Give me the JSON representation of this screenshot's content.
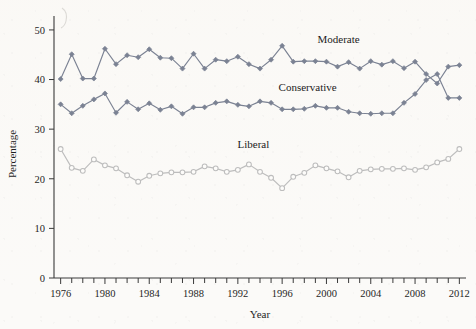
{
  "chart_data": {
    "type": "line",
    "title": "",
    "xlabel": "Year",
    "ylabel": "Percentage",
    "xlim": [
      1975.4,
      2012.6
    ],
    "ylim": [
      0,
      52
    ],
    "grid": false,
    "legend_position": "inline-labels",
    "x_tick_labels": [
      "1976",
      "1980",
      "1984",
      "1988",
      "1992",
      "1996",
      "2000",
      "2004",
      "2008",
      "2012"
    ],
    "x_tick_values": [
      1976,
      1980,
      1984,
      1988,
      1992,
      1996,
      2000,
      2004,
      2008,
      2012
    ],
    "x_minor_tick_values": [
      1976,
      1977,
      1978,
      1979,
      1980,
      1981,
      1982,
      1983,
      1984,
      1985,
      1986,
      1987,
      1988,
      1989,
      1990,
      1991,
      1992,
      1993,
      1994,
      1995,
      1996,
      1997,
      1998,
      1999,
      2000,
      2001,
      2002,
      2003,
      2004,
      2005,
      2006,
      2007,
      2008,
      2009,
      2010,
      2011,
      2012
    ],
    "y_tick_labels": [
      "0",
      "10",
      "20",
      "30",
      "40",
      "50"
    ],
    "y_tick_values": [
      0,
      10,
      20,
      30,
      40,
      50
    ],
    "x": [
      1976,
      1977,
      1978,
      1979,
      1980,
      1981,
      1982,
      1983,
      1984,
      1985,
      1986,
      1987,
      1988,
      1989,
      1990,
      1991,
      1992,
      1993,
      1994,
      1995,
      1996,
      1997,
      1998,
      1999,
      2000,
      2001,
      2002,
      2003,
      2004,
      2005,
      2006,
      2007,
      2008,
      2009,
      2010,
      2011,
      2012
    ],
    "series": [
      {
        "name": "Moderate",
        "color": "#7b8293",
        "marker": "diamond-filled",
        "label_x": 2001.1,
        "label_y": 47.4,
        "values": [
          40.1,
          45.1,
          40.2,
          40.2,
          46.2,
          43.1,
          44.9,
          44.5,
          46.1,
          44.4,
          44.3,
          42.2,
          45.2,
          42.2,
          44.0,
          43.7,
          44.6,
          43.1,
          42.2,
          44.0,
          46.8,
          43.6,
          43.7,
          43.7,
          43.6,
          42.6,
          43.5,
          42.2,
          43.7,
          43.0,
          43.7,
          42.3,
          43.6,
          41.1,
          39.2,
          42.6,
          42.9
        ]
      },
      {
        "name": "Conservative",
        "color": "#7b8293",
        "marker": "diamond-filled",
        "label_x": 1998.3,
        "label_y": 37.7,
        "values": [
          35.0,
          33.2,
          34.7,
          36.0,
          37.2,
          33.3,
          35.5,
          34.0,
          35.2,
          33.9,
          34.6,
          33.1,
          34.4,
          34.4,
          35.3,
          35.6,
          34.9,
          34.6,
          35.6,
          35.3,
          34.0,
          34.0,
          34.1,
          34.7,
          34.3,
          34.3,
          33.5,
          33.2,
          33.1,
          33.2,
          33.2,
          35.3,
          37.1,
          39.9,
          41.1,
          36.3,
          36.3
        ]
      },
      {
        "name": "Liberal",
        "color": "#bdbdbd",
        "marker": "circle-open",
        "label_x": 1993.4,
        "label_y": 26.2,
        "values": [
          26.0,
          22.2,
          21.6,
          23.9,
          22.7,
          22.1,
          20.7,
          19.4,
          20.6,
          21.1,
          21.3,
          21.3,
          21.4,
          22.5,
          22.1,
          21.4,
          21.8,
          22.9,
          21.4,
          20.2,
          18.1,
          20.4,
          21.2,
          22.7,
          22.1,
          21.5,
          20.3,
          21.6,
          21.9,
          22.0,
          22.0,
          22.1,
          21.8,
          22.3,
          23.3,
          24.0,
          26.0
        ]
      }
    ]
  },
  "axis": {
    "x_title": "Year",
    "y_title": "Percentage"
  }
}
